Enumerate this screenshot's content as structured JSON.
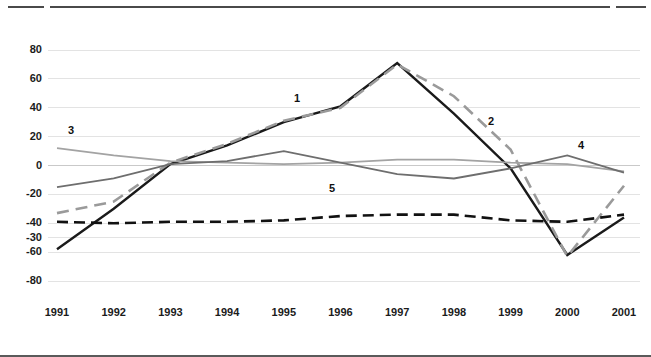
{
  "chart_data": {
    "type": "line",
    "title": "",
    "subtitle": "",
    "xlabel": "",
    "ylabel": "",
    "categories": [
      "1991",
      "1992",
      "1993",
      "1994",
      "1995",
      "1996",
      "1997",
      "1998",
      "1999",
      "2000",
      "2001"
    ],
    "x": [
      1991,
      1992,
      1993,
      1994,
      1995,
      1996,
      1997,
      1998,
      1999,
      2000,
      2001
    ],
    "ylim": [
      -80,
      80
    ],
    "xlim": [
      1991,
      2001
    ],
    "y_tick_labels": [
      "80",
      "60",
      "40",
      "20",
      "0",
      "-20",
      "-40",
      "-30",
      "-60",
      "-80"
    ],
    "y_tick_values": [
      80,
      60,
      40,
      20,
      0,
      -20,
      -40,
      -50,
      -60,
      -80
    ],
    "grid": "horizontal",
    "legend": "inline-numbered-labels",
    "series": [
      {
        "name": "1",
        "label": "1",
        "style": "solid",
        "color": "#1a1a1a",
        "width": 2.4,
        "values": [
          -58,
          -30,
          1,
          14,
          30,
          41,
          71,
          36,
          -2,
          -62,
          -36
        ]
      },
      {
        "name": "2",
        "label": "2",
        "style": "dashed",
        "color": "#9a9a9a",
        "width": 2.6,
        "values": [
          -33,
          -25,
          2,
          15,
          31,
          40,
          70,
          48,
          11,
          -63,
          -14
        ]
      },
      {
        "name": "3",
        "label": "3",
        "style": "solid",
        "color": "#a3a3a3",
        "width": 1.8,
        "values": [
          12,
          7,
          3,
          2,
          1,
          2,
          4,
          4,
          2,
          1,
          -4
        ]
      },
      {
        "name": "4",
        "label": "4",
        "style": "solid",
        "color": "#6e6e6e",
        "width": 1.8,
        "values": [
          -15,
          -9,
          1,
          3,
          10,
          2,
          -6,
          -9,
          -2,
          7,
          -5
        ]
      },
      {
        "name": "5",
        "label": "5",
        "style": "dashed",
        "color": "#111111",
        "width": 2.6,
        "values": [
          -39,
          -40,
          -39,
          -39,
          -38,
          -35,
          -34,
          -34,
          -38,
          -39,
          -34
        ]
      }
    ],
    "series_label_positions": [
      {
        "label": "1",
        "x": 297,
        "y": 99
      },
      {
        "label": "2",
        "x": 491,
        "y": 122
      },
      {
        "label": "3",
        "x": 71,
        "y": 131
      },
      {
        "label": "4",
        "x": 581,
        "y": 146
      },
      {
        "label": "5",
        "x": 332,
        "y": 189
      }
    ]
  }
}
